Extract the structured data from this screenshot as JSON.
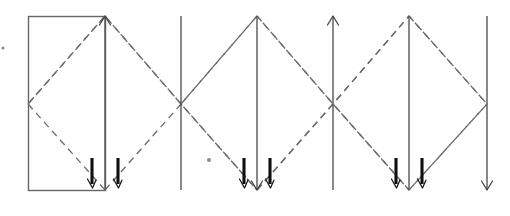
{
  "figure": {
    "canvas": {
      "width": 510,
      "height": 216
    },
    "colors": {
      "background": "#ffffff",
      "solid_line": "#555555",
      "rect_outline": "#666666",
      "dashed_line": "#6a6a6a",
      "thick_tick": "#101010",
      "speck": "#8c8c8c"
    },
    "geometry": {
      "top_y": 16,
      "bottom_y": 190,
      "cross_y": 104,
      "rect": {
        "x": 28,
        "y": 16,
        "width": 77,
        "height": 174
      }
    },
    "vertical_lines": [
      {
        "name": "line-1-rect-right-up-arrow",
        "x": 105,
        "arrow": "up"
      },
      {
        "name": "line-2-plain",
        "x": 181,
        "arrow": "none"
      },
      {
        "name": "line-3-down-arrow",
        "x": 257,
        "arrow": "down"
      },
      {
        "name": "line-4-up-arrow",
        "x": 333,
        "arrow": "up"
      },
      {
        "name": "line-5-plain",
        "x": 409,
        "arrow": "none"
      },
      {
        "name": "line-6-down-arrow",
        "x": 487,
        "arrow": "down"
      }
    ],
    "zigzag_vertices": [
      {
        "x": 28,
        "y": 104
      },
      {
        "x": 105,
        "y": 16
      },
      {
        "x": 181,
        "y": 104
      },
      {
        "x": 257,
        "y": 190
      },
      {
        "x": 333,
        "y": 104
      },
      {
        "x": 409,
        "y": 16
      },
      {
        "x": 487,
        "y": 104
      }
    ],
    "zigzag_second_path": [
      {
        "x": 105,
        "y": 190
      },
      {
        "x": 181,
        "y": 104
      },
      {
        "x": 257,
        "y": 16
      },
      {
        "x": 333,
        "y": 104
      },
      {
        "x": 409,
        "y": 190
      },
      {
        "x": 487,
        "y": 104
      }
    ],
    "crossing_points": [
      {
        "name": "crossing-left",
        "x": 181,
        "y": 104
      },
      {
        "name": "crossing-right",
        "x": 333,
        "y": 104
      }
    ],
    "tick_groups": [
      {
        "name": "tick-group-1",
        "center_x": 105,
        "left_x": 92,
        "right_x": 118,
        "top_y": 158,
        "bottom_y": 186
      },
      {
        "name": "tick-group-2",
        "center_x": 257,
        "left_x": 244,
        "right_x": 270,
        "top_y": 158,
        "bottom_y": 186
      },
      {
        "name": "tick-group-3",
        "center_x": 409,
        "left_x": 396,
        "right_x": 422,
        "top_y": 158,
        "bottom_y": 186
      }
    ],
    "specks": [
      {
        "name": "speck-left-edge",
        "x": 3,
        "y": 48,
        "r": 1.6
      },
      {
        "name": "speck-mid-low",
        "x": 209,
        "y": 160,
        "r": 2.0
      }
    ]
  }
}
